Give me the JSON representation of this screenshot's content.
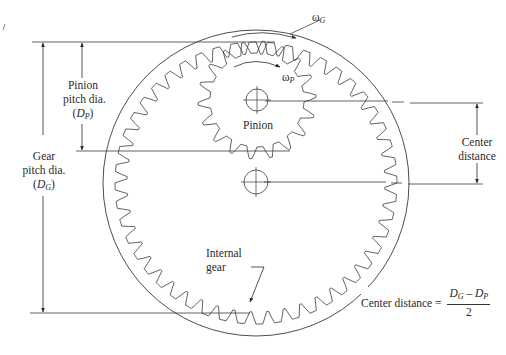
{
  "figure": {
    "type": "internal gear and pinion geometry",
    "corner_mark": "/"
  },
  "labels": {
    "pinion_pitch_dia": [
      "Pinion",
      "pitch dia."
    ],
    "pinion_symbol": {
      "open": "(",
      "D": "D",
      "sub": "P",
      "close": ")"
    },
    "gear_pitch_dia": [
      "Gear",
      "pitch dia."
    ],
    "gear_symbol": {
      "open": "(",
      "D": "D",
      "sub": "G",
      "close": ")"
    },
    "omega_gear": {
      "w": "ω",
      "sub": "G"
    },
    "omega_pinion": {
      "w": "ω",
      "sub": "P"
    },
    "pinion": "Pinion",
    "center_distance": [
      "Center",
      "distance"
    ],
    "internal_gear": [
      "Internal",
      "gear"
    ],
    "formula": {
      "lhs": "Center distance =",
      "num_a": "D",
      "num_a_sub": "G",
      "minus": " – ",
      "num_b": "D",
      "num_b_sub": "P",
      "den": "2"
    }
  },
  "geometry": {
    "outer_circle": {
      "cx": 256,
      "cy": 183,
      "r": 153
    },
    "gear_center": {
      "cx": 256,
      "cy": 183
    },
    "gear_pitch_radius": 135,
    "gear_teeth": 48,
    "pinion_center": {
      "cx": 257,
      "cy": 100
    },
    "pinion_pitch_radius": 53,
    "pinion_teeth": 18,
    "colors": {
      "line": "#3a3a3a",
      "background": "#ffffff"
    }
  }
}
